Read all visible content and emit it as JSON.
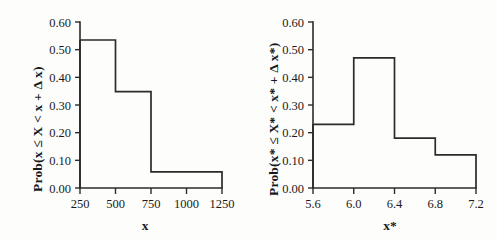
{
  "figure": {
    "background_color": "#fdfdfc",
    "line_color": "#2b2b2b",
    "text_color": "#1a1a1a"
  },
  "chart_data": [
    {
      "id": "left",
      "type": "bar",
      "title": "",
      "xlabel": "x",
      "ylabel": "Prob(x ≤ X < x + Δ x)",
      "xlim": [
        250,
        1250
      ],
      "ylim": [
        0.0,
        0.6
      ],
      "grid": false,
      "legend": null,
      "xticks": [
        250,
        500,
        750,
        1000,
        1250
      ],
      "xticklabels": [
        "250",
        "500",
        "750",
        "1000",
        "1250"
      ],
      "yticks": [
        0.0,
        0.1,
        0.2,
        0.3,
        0.4,
        0.5,
        0.6
      ],
      "yticklabels": [
        "0.00",
        "0.10",
        "0.20",
        "0.30",
        "0.40",
        "0.50",
        "0.60"
      ],
      "bin_edges": [
        250,
        500,
        750,
        1250
      ],
      "values": [
        0.535,
        0.348,
        0.058
      ],
      "bins": [
        {
          "left": 250,
          "right": 500,
          "value": 0.535
        },
        {
          "left": 500,
          "right": 750,
          "value": 0.348
        },
        {
          "left": 750,
          "right": 1250,
          "value": 0.058
        }
      ]
    },
    {
      "id": "right",
      "type": "bar",
      "title": "",
      "xlabel": "x*",
      "ylabel": "Prob(x* ≤ X* < x* + Δ x*)",
      "xlim": [
        5.6,
        7.2
      ],
      "ylim": [
        0.0,
        0.6
      ],
      "grid": false,
      "legend": null,
      "xticks": [
        5.6,
        6.0,
        6.4,
        6.8,
        7.2
      ],
      "xticklabels": [
        "5.6",
        "6.0",
        "6.4",
        "6.8",
        "7.2"
      ],
      "yticks": [
        0.0,
        0.1,
        0.2,
        0.3,
        0.4,
        0.5,
        0.6
      ],
      "yticklabels": [
        "0.00",
        "0.10",
        "0.20",
        "0.30",
        "0.40",
        "0.50",
        "0.60"
      ],
      "bin_edges": [
        5.6,
        6.0,
        6.4,
        6.8,
        7.2
      ],
      "values": [
        0.23,
        0.47,
        0.18,
        0.12
      ],
      "bins": [
        {
          "left": 5.6,
          "right": 6.0,
          "value": 0.23
        },
        {
          "left": 6.0,
          "right": 6.4,
          "value": 0.47
        },
        {
          "left": 6.4,
          "right": 6.8,
          "value": 0.18
        },
        {
          "left": 6.8,
          "right": 7.2,
          "value": 0.12
        }
      ]
    }
  ]
}
